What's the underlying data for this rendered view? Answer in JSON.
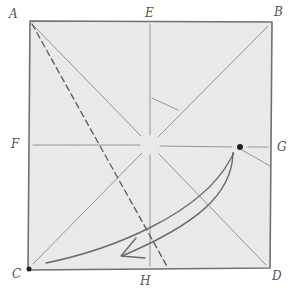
{
  "diagram": {
    "type": "origami-fold-diagram",
    "labels": {
      "A": "A",
      "B": "B",
      "C": "C",
      "D": "D",
      "E": "E",
      "F": "F",
      "G": "G",
      "H": "H"
    },
    "colors": {
      "paper": "#ebebeb",
      "line": "#7a7a7a",
      "dark_line": "#555555",
      "dot": "#222222"
    }
  }
}
